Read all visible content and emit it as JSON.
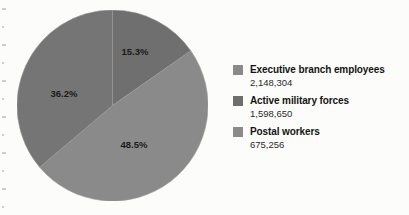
{
  "chart_data": {
    "type": "pie",
    "title": "",
    "labels": [
      "Executive branch employees",
      "Active military forces",
      "Postal workers"
    ],
    "values": [
      2148304,
      1598650,
      675256
    ],
    "value_text": [
      "2,148,304",
      "1,598,650",
      "675,256"
    ],
    "percent_labels": [
      "48.5%",
      "36.2%",
      "15.3%"
    ],
    "percents": [
      48.5,
      36.2,
      15.3
    ],
    "slice_colors": [
      "#8a8a8a",
      "#757575",
      "#6f6f6f"
    ],
    "legend_position": "right",
    "grid": false,
    "slice_order_clockwise_from_top": [
      "15.3%",
      "48.5%",
      "36.2%"
    ]
  },
  "pie": {
    "slices": [
      {
        "name": "postal-workers",
        "percent_label": "15.3%",
        "percent": 15.3,
        "color": "#6f6f6f",
        "label_x": 118,
        "label_y": 45
      },
      {
        "name": "executive-branch-employees",
        "percent_label": "48.5%",
        "percent": 48.5,
        "color": "#8a8a8a",
        "label_x": 117,
        "label_y": 138
      },
      {
        "name": "active-military-forces",
        "percent_label": "36.2%",
        "percent": 36.2,
        "color": "#757575",
        "label_x": 47,
        "label_y": 87
      }
    ]
  },
  "legend": {
    "items": [
      {
        "label": "Executive branch employees",
        "value": "2,148,304",
        "color": "#8a8a8a"
      },
      {
        "label": "Active military forces",
        "value": "1,598,650",
        "color": "#6e6e6e"
      },
      {
        "label": "Postal workers",
        "value": "675,256",
        "color": "#8a8a8a"
      }
    ]
  }
}
